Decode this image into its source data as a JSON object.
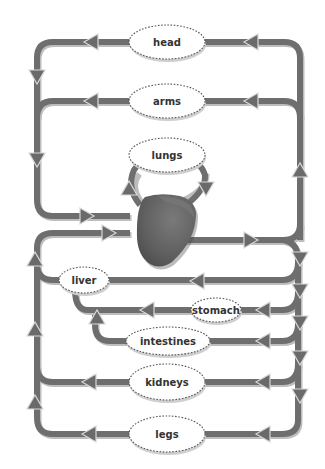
{
  "diagram": {
    "type": "circulatory-system",
    "organs": [
      {
        "id": "head",
        "label": "head",
        "cx": 167,
        "cy": 42,
        "rx": 38,
        "ry": 17
      },
      {
        "id": "arms",
        "label": "arms",
        "cx": 167,
        "cy": 101,
        "rx": 38,
        "ry": 17
      },
      {
        "id": "lungs",
        "label": "lungs",
        "cx": 167,
        "cy": 155,
        "rx": 38,
        "ry": 17
      },
      {
        "id": "liver",
        "label": "liver",
        "cx": 84,
        "cy": 280,
        "rx": 25,
        "ry": 13
      },
      {
        "id": "stomach",
        "label": "stomach",
        "cx": 216,
        "cy": 310,
        "rx": 25,
        "ry": 12
      },
      {
        "id": "intestines",
        "label": "intestines",
        "cx": 168,
        "cy": 341,
        "rx": 42,
        "ry": 14
      },
      {
        "id": "kidneys",
        "label": "kidneys",
        "cx": 167,
        "cy": 382,
        "rx": 38,
        "ry": 18
      },
      {
        "id": "legs",
        "label": "legs",
        "cx": 167,
        "cy": 434,
        "rx": 38,
        "ry": 18
      }
    ],
    "heart_label": "heart",
    "colors": {
      "pipe": "#6e6e6e",
      "pipe_shadow": "#bdbdbd",
      "arrow": "#6a6a6a",
      "heart": "#5f5f5f",
      "organ_fill": "#ffffff"
    }
  }
}
